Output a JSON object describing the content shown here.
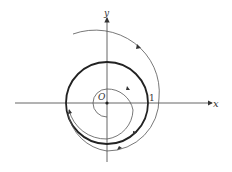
{
  "diagram": {
    "type": "phase portrait",
    "axes": {
      "x_label": "x",
      "y_label": "y",
      "origin_label": "O"
    },
    "tick_labels": [
      "1"
    ],
    "elements": [
      {
        "name": "limit-cycle",
        "description": "unit circle (radius 1), bold"
      },
      {
        "name": "outer-trajectory",
        "description": "spiral from outside approaching the circle, clockwise"
      },
      {
        "name": "inner-trajectory",
        "description": "spiral from near origin approaching the circle, clockwise"
      },
      {
        "name": "origin-point",
        "description": "equilibrium at origin"
      }
    ],
    "colors": {
      "ink": "#333333",
      "background": "#ffffff"
    }
  }
}
